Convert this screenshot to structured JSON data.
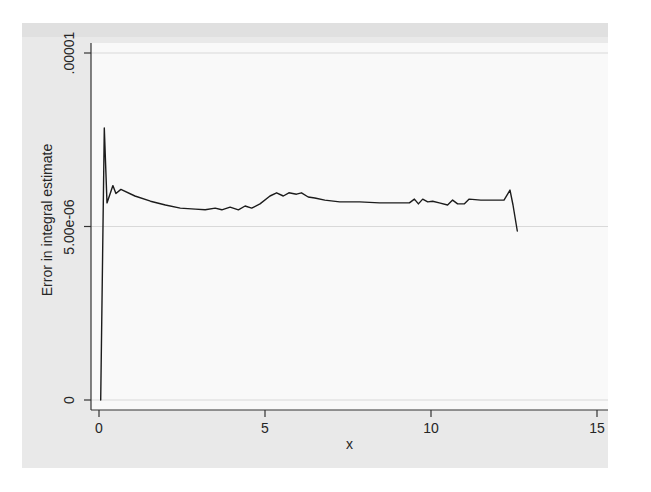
{
  "figure": {
    "page_bg": "#ffffff",
    "region_bg": "#e9e9e9",
    "plot_bg": "#f9f9f9",
    "grid_color": "#d9d9d9",
    "axis_color": "#333333",
    "line_color": "#1c1c1c",
    "text_color": "#262626"
  },
  "chart_data": {
    "type": "line",
    "title": "",
    "xlabel": "x",
    "ylabel": "Error in integral estimate",
    "xlim": [
      0,
      15
    ],
    "ylim": [
      0,
      1e-05
    ],
    "grid": "horizontal gridlines at labeled y ticks",
    "legend": "none",
    "x_ticks": [
      {
        "value": 0,
        "label": "0"
      },
      {
        "value": 5,
        "label": "5"
      },
      {
        "value": 10,
        "label": "10"
      },
      {
        "value": 15,
        "label": "15"
      }
    ],
    "y_ticks": [
      {
        "value": 0,
        "label": "0"
      },
      {
        "value": 5e-06,
        "label": "5.00e-06"
      },
      {
        "value": 1e-05,
        "label": ".00001"
      }
    ],
    "series": [
      {
        "name": "error-in-integral-estimate",
        "y_unit": "1e-06",
        "points": [
          [
            0.05,
            0.0
          ],
          [
            0.16,
            7.84
          ],
          [
            0.24,
            5.68
          ],
          [
            0.42,
            6.18
          ],
          [
            0.51,
            5.95
          ],
          [
            0.66,
            6.07
          ],
          [
            1.08,
            5.88
          ],
          [
            1.55,
            5.73
          ],
          [
            2.0,
            5.62
          ],
          [
            2.45,
            5.53
          ],
          [
            2.9,
            5.5
          ],
          [
            3.2,
            5.48
          ],
          [
            3.5,
            5.53
          ],
          [
            3.7,
            5.48
          ],
          [
            3.95,
            5.56
          ],
          [
            4.2,
            5.48
          ],
          [
            4.4,
            5.59
          ],
          [
            4.6,
            5.53
          ],
          [
            4.85,
            5.65
          ],
          [
            5.15,
            5.88
          ],
          [
            5.35,
            5.97
          ],
          [
            5.55,
            5.88
          ],
          [
            5.72,
            5.97
          ],
          [
            5.95,
            5.93
          ],
          [
            6.1,
            5.97
          ],
          [
            6.3,
            5.85
          ],
          [
            6.5,
            5.82
          ],
          [
            6.8,
            5.76
          ],
          [
            7.25,
            5.71
          ],
          [
            7.85,
            5.71
          ],
          [
            8.45,
            5.68
          ],
          [
            9.05,
            5.68
          ],
          [
            9.35,
            5.68
          ],
          [
            9.5,
            5.79
          ],
          [
            9.62,
            5.65
          ],
          [
            9.75,
            5.79
          ],
          [
            9.9,
            5.71
          ],
          [
            10.05,
            5.73
          ],
          [
            10.25,
            5.68
          ],
          [
            10.5,
            5.62
          ],
          [
            10.65,
            5.76
          ],
          [
            10.8,
            5.65
          ],
          [
            11.0,
            5.65
          ],
          [
            11.15,
            5.79
          ],
          [
            11.5,
            5.76
          ],
          [
            11.9,
            5.76
          ],
          [
            12.2,
            5.76
          ],
          [
            12.38,
            6.05
          ],
          [
            12.47,
            5.62
          ],
          [
            12.6,
            4.87
          ]
        ]
      }
    ]
  }
}
